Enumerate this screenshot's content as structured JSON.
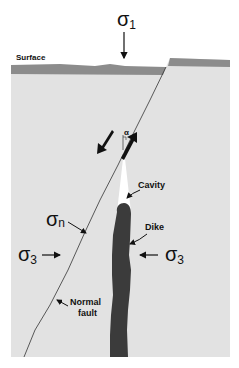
{
  "diagram": {
    "colors": {
      "background": "#ffffff",
      "block": "#e2e2e2",
      "surface_layer": "#8c8c8c",
      "dike": "#3b3b3b",
      "cavity": "#ffffff",
      "line": "#333333"
    },
    "labels": {
      "surface": "Surface",
      "sigma1": "σ",
      "sigma1_sub": "1",
      "sigma_n": "σ",
      "sigma_n_sub": "n",
      "sigma3_left": "σ",
      "sigma3_left_sub": "3",
      "sigma3_right": "σ",
      "sigma3_right_sub": "3",
      "alpha": "α",
      "cavity": "Cavity",
      "dike": "Dike",
      "normal_fault_line1": "Normal",
      "normal_fault_line2": "fault"
    }
  }
}
